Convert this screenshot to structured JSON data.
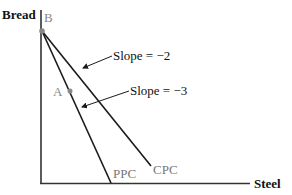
{
  "diagram": {
    "axes": {
      "y_label": "Bread",
      "x_label": "Steel"
    },
    "points": {
      "B": {
        "label": "B"
      },
      "A": {
        "label": "A"
      }
    },
    "curves": {
      "ppc": {
        "label": "PPC"
      },
      "cpc": {
        "label": "CPC"
      }
    },
    "annotations": {
      "slope_cpc": "Slope = −2",
      "slope_ppc": "Slope = −3"
    },
    "colors": {
      "line": "#1a1a1a",
      "point": "#888888",
      "faded_label": "#888888"
    }
  }
}
